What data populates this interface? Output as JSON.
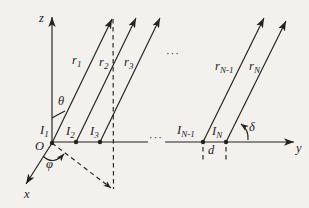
{
  "colors": {
    "background": "#f2f1ee",
    "ink": "#24211d"
  },
  "canvas": {
    "width": 309,
    "height": 208
  },
  "labels": {
    "z_axis": "z",
    "y_axis": "y",
    "x_axis": "x",
    "origin": "O",
    "theta": "θ",
    "phi": "φ",
    "delta": "δ",
    "spacing": "d",
    "ellipsis_top": "···",
    "ellipsis_axis": "···"
  },
  "rays": [
    {
      "name": "ray-r1",
      "label": "r",
      "sub": "1"
    },
    {
      "name": "ray-r2",
      "label": "r",
      "sub": "2"
    },
    {
      "name": "ray-r3",
      "label": "r",
      "sub": "3"
    },
    {
      "name": "ray-rN-1",
      "label": "r",
      "sub": "N-1"
    },
    {
      "name": "ray-rN",
      "label": "r",
      "sub": "N"
    }
  ],
  "elements": [
    {
      "name": "element-I1",
      "label": "I",
      "sub": "1"
    },
    {
      "name": "element-I2",
      "label": "I",
      "sub": "2"
    },
    {
      "name": "element-I3",
      "label": "I",
      "sub": "3"
    },
    {
      "name": "element-IN-1",
      "label": "I",
      "sub": "N-1"
    },
    {
      "name": "element-IN",
      "label": "I",
      "sub": "N"
    }
  ],
  "geometry": {
    "stroke_width": 1.15,
    "dash_pattern": "4.5 3.5",
    "lines": [
      {
        "name": "z-axis",
        "x1": 52,
        "y1": 143,
        "x2": 52,
        "y2": 17,
        "arrow": "big"
      },
      {
        "name": "y-axis-segment-left",
        "x1": 52,
        "y1": 142,
        "x2": 148,
        "y2": 142
      },
      {
        "name": "y-axis-segment-right",
        "x1": 165,
        "y1": 142,
        "x2": 294,
        "y2": 142,
        "arrow": "big"
      },
      {
        "name": "x-axis",
        "x1": 52,
        "y1": 143,
        "x2": 26,
        "y2": 184,
        "arrow": "big"
      },
      {
        "name": "ray-r1-line",
        "x1": 52,
        "y1": 143,
        "x2": 112,
        "y2": 19,
        "arrow": "big"
      },
      {
        "name": "ray-r2-line",
        "x1": 76,
        "y1": 142,
        "x2": 136,
        "y2": 18,
        "arrow": "big"
      },
      {
        "name": "ray-r3-line",
        "x1": 100,
        "y1": 142,
        "x2": 160,
        "y2": 18,
        "arrow": "big"
      },
      {
        "name": "ray-rN-1-line",
        "x1": 203,
        "y1": 142,
        "x2": 264,
        "y2": 18,
        "arrow": "big"
      },
      {
        "name": "ray-rN-line",
        "x1": 226,
        "y1": 142,
        "x2": 286,
        "y2": 21,
        "arrow": "big"
      },
      {
        "name": "projection-vertical-dashed",
        "x1": 113,
        "y1": 19,
        "x2": 113.5,
        "y2": 189,
        "dashed": true
      },
      {
        "name": "projection-diagonal-dashed",
        "x1": 52,
        "y1": 143,
        "x2": 111,
        "y2": 188,
        "dashed": true,
        "arrow": "small"
      },
      {
        "name": "spacing-tick-IN-1",
        "x1": 203,
        "y1": 147,
        "x2": 203,
        "y2": 160,
        "dashed": true
      },
      {
        "name": "spacing-tick-IN",
        "x1": 226,
        "y1": 147,
        "x2": 226,
        "y2": 161,
        "dashed": true
      }
    ],
    "dots": [
      {
        "name": "element-dot-I1",
        "cx": 52,
        "cy": 143
      },
      {
        "name": "element-dot-I2",
        "cx": 76,
        "cy": 142
      },
      {
        "name": "element-dot-I3",
        "cx": 100,
        "cy": 142
      },
      {
        "name": "element-dot-IN-1",
        "cx": 203,
        "cy": 142
      },
      {
        "name": "element-dot-IN",
        "cx": 226,
        "cy": 142
      }
    ],
    "arcs": [
      {
        "name": "theta-arc",
        "d": "M 52 118 Q 59 114 65 111"
      },
      {
        "name": "phi-arc",
        "d": "M 43 156 Q 53 166 64 154",
        "arrow": "small"
      },
      {
        "name": "delta-arc",
        "d": "M 248 140 Q 249 130 241 124",
        "arrow": "small"
      }
    ],
    "texts": [
      {
        "name": "z-axis-label",
        "x": 39,
        "y": 22,
        "ref": "labels.z_axis"
      },
      {
        "name": "y-axis-label",
        "x": 296,
        "y": 152,
        "ref": "labels.y_axis"
      },
      {
        "name": "x-axis-label",
        "x": 24,
        "y": 198,
        "ref": "labels.x_axis"
      },
      {
        "name": "origin-label",
        "x": 35,
        "y": 150,
        "ref": "labels.origin"
      },
      {
        "name": "theta-label",
        "x": 58,
        "y": 105,
        "ref": "labels.theta"
      },
      {
        "name": "phi-label",
        "x": 46,
        "y": 168,
        "ref": "labels.phi"
      },
      {
        "name": "delta-label",
        "x": 249,
        "y": 131,
        "ref": "labels.delta"
      },
      {
        "name": "spacing-label",
        "x": 208,
        "y": 154,
        "ref": "labels.spacing"
      },
      {
        "name": "ellipsis-top",
        "x": 166,
        "y": 57,
        "ref": "labels.ellipsis_top",
        "italic": false,
        "size": 11
      },
      {
        "name": "ellipsis-axis",
        "x": 149,
        "y": 141,
        "ref": "labels.ellipsis_axis",
        "italic": false,
        "size": 11
      },
      {
        "name": "ray-r1-label",
        "x": 72,
        "y": 64,
        "ref": "rays.0.label",
        "sub": "rays.0.sub"
      },
      {
        "name": "ray-r2-label",
        "x": 99,
        "y": 66,
        "ref": "rays.1.label",
        "sub": "rays.1.sub"
      },
      {
        "name": "ray-r3-label",
        "x": 124,
        "y": 66,
        "ref": "rays.2.label",
        "sub": "rays.2.sub"
      },
      {
        "name": "ray-rN-1-label",
        "x": 215,
        "y": 70,
        "ref": "rays.3.label",
        "sub": "rays.3.sub"
      },
      {
        "name": "ray-rN-label",
        "x": 249,
        "y": 70,
        "ref": "rays.4.label",
        "sub": "rays.4.sub"
      },
      {
        "name": "element-I1-label",
        "x": 40,
        "y": 134,
        "ref": "elements.0.label",
        "sub": "elements.0.sub"
      },
      {
        "name": "element-I2-label",
        "x": 66,
        "y": 135,
        "ref": "elements.1.label",
        "sub": "elements.1.sub"
      },
      {
        "name": "element-I3-label",
        "x": 90,
        "y": 135,
        "ref": "elements.2.label",
        "sub": "elements.2.sub"
      },
      {
        "name": "element-IN-1-label",
        "x": 177,
        "y": 134,
        "ref": "elements.3.label",
        "sub": "elements.3.sub"
      },
      {
        "name": "element-IN-label",
        "x": 212,
        "y": 135,
        "ref": "elements.4.label",
        "sub": "elements.4.sub"
      }
    ]
  }
}
